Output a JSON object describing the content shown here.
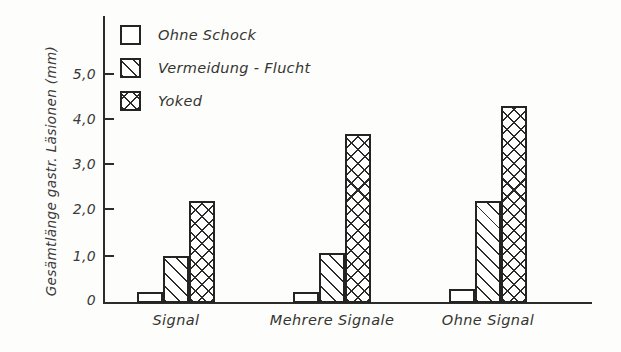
{
  "chart_data": {
    "type": "bar",
    "title": "",
    "xlabel": "",
    "ylabel": "Gesämtlänge gastr. Läsionen (mm)",
    "categories": [
      "Signal",
      "Mehrere Signale",
      "Ohne Signal"
    ],
    "series": [
      {
        "name": "Ohne Schock",
        "pattern": "plain",
        "values": [
          0.25,
          0.25,
          0.3
        ]
      },
      {
        "name": "Vermeidung - Flucht",
        "pattern": "diagonal",
        "values": [
          1.05,
          1.1,
          2.25
        ]
      },
      {
        "name": "Yoked",
        "pattern": "cross-hatch",
        "values": [
          2.25,
          3.75,
          4.35
        ]
      }
    ],
    "ylim": [
      0,
      5.6
    ],
    "yticks": [
      0,
      1.0,
      2.0,
      3.0,
      4.0,
      5.0
    ],
    "ytick_labels": [
      "0",
      "1,0",
      "2,0",
      "3,0",
      "4,0",
      "5,0"
    ],
    "grid": false,
    "legend_position": "top-left",
    "colors": {
      "axis": "#2c2c2a",
      "bar_outline": "#242422",
      "bar_fill": "#ffffff",
      "text": "#35352f",
      "background": "#fdfdfc"
    }
  },
  "legend": {
    "entries": [
      {
        "label": "Ohne Schock",
        "swatch": "plain-square-icon"
      },
      {
        "label": "Vermeidung - Flucht",
        "swatch": "diagonal-hatch-square-icon"
      },
      {
        "label": "Yoked",
        "swatch": "cross-hatch-square-icon"
      }
    ]
  },
  "axes": {
    "y_label": "Gesämtlänge gastr. Läsionen (mm)",
    "y_ticks": [
      "5,0",
      "4,0",
      "3,0",
      "2,0",
      "1,0",
      "0"
    ],
    "x_ticks": [
      "Signal",
      "Mehrere Signale",
      "Ohne Signal"
    ]
  }
}
